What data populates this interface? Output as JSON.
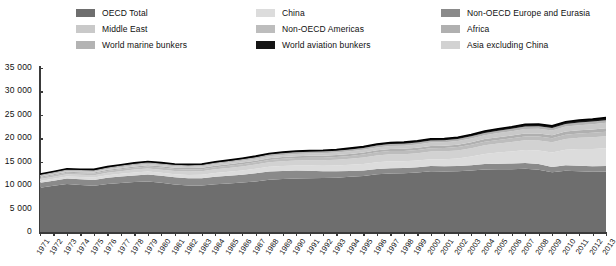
{
  "legend": {
    "columns": [
      [
        {
          "label": "OECD Total",
          "color": "#6e6e6e",
          "key": "oecd_total"
        },
        {
          "label": "Middle East",
          "color": "#c9c9c9",
          "key": "middle_east"
        },
        {
          "label": "World marine bunkers",
          "color": "#b3b3b3",
          "key": "world_marine_bunkers"
        }
      ],
      [
        {
          "label": "China",
          "color": "#dcdcdc",
          "key": "china"
        },
        {
          "label": "Non-OECD Americas",
          "color": "#bdbdbd",
          "key": "non_oecd_americas"
        },
        {
          "label": "World aviation bunkers",
          "color": "#151515",
          "key": "world_aviation_bunkers"
        }
      ],
      [
        {
          "label": "Non-OECD Europe and Eurasia",
          "color": "#8a8a8a",
          "key": "non_oecd_europe_eurasia"
        },
        {
          "label": "Africa",
          "color": "#b0b0b0",
          "key": "africa"
        },
        {
          "label": "Asia excluding China",
          "color": "#d2d2d2",
          "key": "asia_excluding_china"
        }
      ]
    ]
  },
  "chart_data": {
    "type": "area",
    "stacked": true,
    "title": "",
    "subtitle": "",
    "xlabel": "",
    "ylabel": "",
    "ylim": [
      0,
      35000
    ],
    "yticks": [
      "0",
      "5 000",
      "10 000",
      "15 000",
      "20 000",
      "25 000",
      "30 000",
      "35 000"
    ],
    "ytick_values": [
      0,
      5000,
      10000,
      15000,
      20000,
      25000,
      30000,
      35000
    ],
    "grid": false,
    "legend_position": "top",
    "categories": [
      "1971",
      "1972",
      "1973",
      "1974",
      "1975",
      "1976",
      "1977",
      "1978",
      "1979",
      "1980",
      "1981",
      "1982",
      "1983",
      "1984",
      "1985",
      "1986",
      "1987",
      "1988",
      "1989",
      "1990",
      "1991",
      "1992",
      "1993",
      "1994",
      "1995",
      "1996",
      "1997",
      "1998",
      "1999",
      "2000",
      "2001",
      "2002",
      "2003",
      "2004",
      "2005",
      "2006",
      "2007",
      "2008",
      "2009",
      "2010",
      "2011",
      "2012",
      "2013"
    ],
    "series": [
      {
        "name": "OECD Total",
        "color": "#6e6e6e",
        "values": [
          9450,
          9850,
          10250,
          10050,
          9850,
          10250,
          10450,
          10650,
          10800,
          10500,
          10150,
          9950,
          9900,
          10200,
          10350,
          10550,
          10800,
          11150,
          11300,
          11400,
          11450,
          11500,
          11600,
          11800,
          11950,
          12300,
          12500,
          12550,
          12700,
          12950,
          12900,
          12950,
          13100,
          13350,
          13400,
          13400,
          13500,
          13300,
          12750,
          13050,
          12950,
          12850,
          12900
        ]
      },
      {
        "name": "Non-OECD Europe and Eurasia",
        "color": "#8a8a8a",
        "values": [
          1050,
          1100,
          1150,
          1200,
          1260,
          1320,
          1370,
          1420,
          1460,
          1480,
          1510,
          1540,
          1570,
          1600,
          1640,
          1680,
          1720,
          1750,
          1740,
          1700,
          1620,
          1450,
          1340,
          1230,
          1180,
          1170,
          1130,
          1110,
          1110,
          1110,
          1120,
          1120,
          1150,
          1170,
          1180,
          1200,
          1200,
          1210,
          1140,
          1190,
          1200,
          1190,
          1180
        ]
      },
      {
        "name": "China",
        "color": "#dcdcdc",
        "values": [
          400,
          430,
          460,
          470,
          520,
          540,
          590,
          640,
          660,
          670,
          670,
          700,
          740,
          800,
          860,
          900,
          960,
          1020,
          1060,
          1090,
          1130,
          1180,
          1250,
          1310,
          1400,
          1430,
          1460,
          1440,
          1440,
          1490,
          1530,
          1620,
          1850,
          2130,
          2380,
          2600,
          2800,
          2900,
          3050,
          3300,
          3550,
          3700,
          3800
        ]
      },
      {
        "name": "Asia excluding China",
        "color": "#d2d2d2",
        "values": [
          400,
          430,
          470,
          480,
          500,
          540,
          570,
          610,
          640,
          660,
          680,
          710,
          740,
          780,
          820,
          860,
          900,
          960,
          1010,
          1070,
          1120,
          1180,
          1240,
          1300,
          1380,
          1450,
          1500,
          1490,
          1560,
          1620,
          1660,
          1720,
          1790,
          1870,
          1930,
          2000,
          2080,
          2130,
          2200,
          2330,
          2400,
          2480,
          2560
        ]
      },
      {
        "name": "Non-OECD Americas",
        "color": "#bdbdbd",
        "values": [
          300,
          315,
          335,
          345,
          355,
          375,
          390,
          410,
          425,
          430,
          430,
          440,
          440,
          450,
          460,
          480,
          490,
          505,
          520,
          530,
          545,
          560,
          575,
          600,
          620,
          645,
          670,
          685,
          690,
          700,
          700,
          710,
          715,
          740,
          770,
          790,
          820,
          850,
          850,
          890,
          920,
          950,
          970
        ]
      },
      {
        "name": "Africa",
        "color": "#b0b0b0",
        "values": [
          180,
          190,
          200,
          210,
          220,
          235,
          245,
          260,
          270,
          280,
          290,
          300,
          310,
          320,
          330,
          345,
          355,
          365,
          375,
          385,
          395,
          405,
          415,
          425,
          440,
          455,
          465,
          475,
          485,
          500,
          510,
          525,
          545,
          565,
          580,
          600,
          620,
          640,
          655,
          675,
          685,
          700,
          715
        ]
      },
      {
        "name": "Middle East",
        "color": "#c9c9c9",
        "values": [
          120,
          130,
          145,
          155,
          170,
          190,
          210,
          230,
          250,
          265,
          280,
          300,
          320,
          340,
          360,
          380,
          400,
          420,
          440,
          460,
          485,
          510,
          530,
          555,
          580,
          605,
          630,
          660,
          690,
          710,
          730,
          760,
          790,
          830,
          870,
          905,
          950,
          990,
          1020,
          1060,
          1100,
          1140,
          1180
        ]
      },
      {
        "name": "World marine bunkers",
        "color": "#b3b3b3",
        "values": [
          330,
          340,
          350,
          340,
          330,
          340,
          345,
          350,
          355,
          340,
          325,
          310,
          300,
          305,
          310,
          320,
          330,
          345,
          355,
          365,
          370,
          375,
          380,
          390,
          400,
          410,
          420,
          425,
          430,
          440,
          445,
          455,
          470,
          490,
          505,
          520,
          535,
          545,
          520,
          545,
          555,
          560,
          565
        ]
      },
      {
        "name": "World aviation bunkers",
        "color": "#151515",
        "values": [
          130,
          140,
          150,
          150,
          155,
          165,
          175,
          185,
          195,
          190,
          185,
          185,
          190,
          200,
          210,
          225,
          240,
          255,
          265,
          275,
          270,
          280,
          285,
          295,
          310,
          325,
          340,
          350,
          365,
          385,
          375,
          375,
          385,
          410,
          430,
          455,
          480,
          480,
          465,
          490,
          510,
          525,
          540
        ]
      }
    ]
  }
}
